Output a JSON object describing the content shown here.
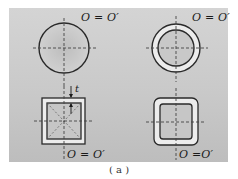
{
  "figure": {
    "caption": "( a )",
    "panels": [
      {
        "id": "solid-circle",
        "shape": "solid circular section",
        "label": "O = O′"
      },
      {
        "id": "hollow-circle",
        "shape": "hollow circular (ring) section",
        "label": "O = O′"
      },
      {
        "id": "hollow-square",
        "shape": "thin-walled square section",
        "label": "O = O′",
        "thickness_label": "t"
      },
      {
        "id": "hollow-rounded-square",
        "shape": "thin-walled rounded square section",
        "label": "O =O′"
      }
    ],
    "colors": {
      "panel_bg": "#cccccc",
      "stroke": "#2a2a2a",
      "wall_fill": "#ececec",
      "axis_dash": "#444444"
    }
  }
}
